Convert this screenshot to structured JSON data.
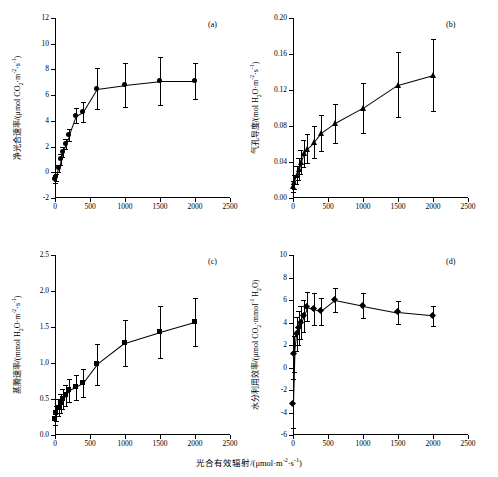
{
  "figure": {
    "xlabel_main": "光合有效辐射/(μmol·m⁻²·s⁻¹)",
    "panels": [
      "(a)",
      "(b)",
      "(c)",
      "(d)"
    ]
  },
  "chart_data": [
    {
      "type": "scatter",
      "panel": "(a)",
      "title": "",
      "xlabel": "光合有效辐射/(μmol·m⁻²·s⁻¹)",
      "ylabel": "净光合速率/(μmol CO₂·m⁻²·s⁻¹)",
      "xlim": [
        0,
        2500
      ],
      "ylim": [
        -2,
        12
      ],
      "xticks": [
        0,
        500,
        1000,
        1500,
        2000,
        2500
      ],
      "yticks": [
        -2,
        0,
        2,
        4,
        6,
        8,
        10,
        12
      ],
      "marker": "circle",
      "grid": false,
      "legend": "none",
      "x": [
        0,
        20,
        50,
        80,
        110,
        150,
        200,
        300,
        400,
        600,
        1000,
        1500,
        2000
      ],
      "y": [
        -0.5,
        -0.4,
        0.3,
        1.0,
        1.6,
        2.2,
        2.9,
        4.4,
        4.7,
        6.5,
        6.8,
        7.1,
        7.1
      ],
      "yerr": [
        0.3,
        0.3,
        0.3,
        0.4,
        0.4,
        0.4,
        0.5,
        0.6,
        0.8,
        1.6,
        1.7,
        1.9,
        1.4
      ]
    },
    {
      "type": "scatter",
      "panel": "(b)",
      "title": "",
      "xlabel": "光合有效辐射/(μmol·m⁻²·s⁻¹)",
      "ylabel": "气孔导度/(mol H₂O·m⁻²·s⁻¹)",
      "xlim": [
        0,
        2500
      ],
      "ylim": [
        0.0,
        0.2
      ],
      "xticks": [
        0,
        500,
        1000,
        1500,
        2000,
        2500
      ],
      "yticks": [
        0.0,
        0.04,
        0.08,
        0.12,
        0.16,
        0.2
      ],
      "marker": "triangle",
      "grid": false,
      "legend": "none",
      "x": [
        0,
        20,
        50,
        80,
        110,
        150,
        200,
        300,
        400,
        600,
        1000,
        1500,
        2000
      ],
      "y": [
        0.013,
        0.018,
        0.026,
        0.032,
        0.04,
        0.05,
        0.055,
        0.062,
        0.072,
        0.083,
        0.1,
        0.126,
        0.137
      ],
      "yerr": [
        0.006,
        0.008,
        0.01,
        0.012,
        0.013,
        0.015,
        0.016,
        0.018,
        0.02,
        0.022,
        0.028,
        0.036,
        0.04
      ]
    },
    {
      "type": "scatter",
      "panel": "(c)",
      "title": "",
      "xlabel": "光合有效辐射/(μmol·m⁻²·s⁻¹)",
      "ylabel": "蒸腾速率/(mmol H₂O·m⁻²·s⁻¹)",
      "xlim": [
        0,
        2500
      ],
      "ylim": [
        0.0,
        2.5
      ],
      "xticks": [
        0,
        500,
        1000,
        1500,
        2000,
        2500
      ],
      "yticks": [
        0.0,
        0.5,
        1.0,
        1.5,
        2.0,
        2.5
      ],
      "marker": "square",
      "grid": false,
      "legend": "none",
      "x": [
        0,
        20,
        50,
        80,
        110,
        150,
        200,
        300,
        400,
        600,
        1000,
        1500,
        2000
      ],
      "y": [
        0.22,
        0.3,
        0.38,
        0.44,
        0.5,
        0.55,
        0.62,
        0.66,
        0.72,
        0.98,
        1.28,
        1.43,
        1.57
      ],
      "yerr": [
        0.08,
        0.1,
        0.12,
        0.13,
        0.14,
        0.15,
        0.16,
        0.17,
        0.19,
        0.28,
        0.32,
        0.36,
        0.33
      ]
    },
    {
      "type": "scatter",
      "panel": "(d)",
      "title": "",
      "xlabel": "光合有效辐射/(μmol·m⁻²·s⁻¹)",
      "ylabel": "水分利用效率/(μmol CO₂·mmol⁻¹ H₂O)",
      "xlim": [
        0,
        2500
      ],
      "ylim": [
        -6,
        10
      ],
      "xticks": [
        0,
        500,
        1000,
        1500,
        2000,
        2500
      ],
      "yticks": [
        -6,
        -4,
        -2,
        0,
        2,
        4,
        6,
        8,
        10
      ],
      "marker": "diamond",
      "grid": false,
      "legend": "none",
      "x": [
        0,
        20,
        50,
        80,
        110,
        150,
        200,
        300,
        400,
        600,
        1000,
        1500,
        2000
      ],
      "y": [
        -3.2,
        1.2,
        3.0,
        3.5,
        4.0,
        4.6,
        5.4,
        5.2,
        5.0,
        6.0,
        5.5,
        4.9,
        4.6
      ],
      "yerr": [
        2.2,
        1.6,
        1.5,
        1.5,
        1.5,
        1.4,
        1.3,
        1.4,
        1.2,
        1.1,
        1.1,
        1.0,
        0.9
      ]
    }
  ]
}
